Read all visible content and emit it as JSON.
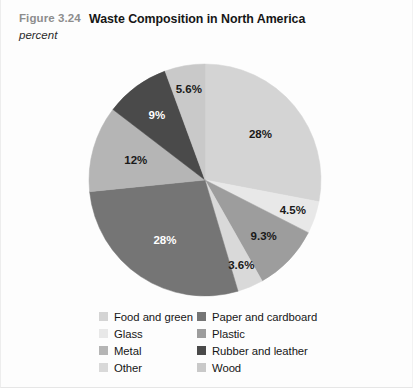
{
  "figure": {
    "number": "Figure 3.24",
    "title": "Waste Composition in North America",
    "units": "percent"
  },
  "chart_data": {
    "type": "pie",
    "title": "Waste Composition in North America",
    "subtitle": "Figure 3.24",
    "units": "percent",
    "ylabel": "",
    "xlabel": "",
    "legend_position": "bottom",
    "start_angle_deg": 0,
    "direction": "clockwise",
    "categories": [
      "Food and green",
      "Glass",
      "Plastic",
      "Other",
      "Paper and cardboard",
      "Metal",
      "Rubber and leather",
      "Wood"
    ],
    "values": [
      28,
      4.5,
      9.3,
      3.6,
      28,
      12,
      9,
      5.6
    ],
    "slices": [
      {
        "label": "Food and green",
        "value": 28,
        "display": "28%",
        "color": "#d4d4d4",
        "text_color": "#1a1a1a"
      },
      {
        "label": "Glass",
        "value": 4.5,
        "display": "4.5%",
        "color": "#e8e8e8",
        "text_color": "#1a1a1a"
      },
      {
        "label": "Plastic",
        "value": 9.3,
        "display": "9.3%",
        "color": "#9d9d9d",
        "text_color": "#1a1a1a"
      },
      {
        "label": "Other",
        "value": 3.6,
        "display": "3.6%",
        "color": "#d9d9d9",
        "text_color": "#1a1a1a"
      },
      {
        "label": "Paper and cardboard",
        "value": 28,
        "display": "28%",
        "color": "#757575",
        "text_color": "#ffffff"
      },
      {
        "label": "Metal",
        "value": 12,
        "display": "12%",
        "color": "#b5b5b5",
        "text_color": "#1a1a1a"
      },
      {
        "label": "Rubber and leather",
        "value": 9,
        "display": "9%",
        "color": "#4a4a4a",
        "text_color": "#ffffff"
      },
      {
        "label": "Wood",
        "value": 5.6,
        "display": "5.6%",
        "color": "#c9c9c9",
        "text_color": "#1a1a1a"
      }
    ]
  },
  "legend": {
    "left_column": [
      {
        "label": "Food and green",
        "color": "#d4d4d4"
      },
      {
        "label": "Glass",
        "color": "#e8e8e8"
      },
      {
        "label": "Metal",
        "color": "#b5b5b5"
      },
      {
        "label": "Other",
        "color": "#d9d9d9"
      }
    ],
    "right_column": [
      {
        "label": "Paper and cardboard",
        "color": "#757575"
      },
      {
        "label": "Plastic",
        "color": "#9d9d9d"
      },
      {
        "label": "Rubber and leather",
        "color": "#4a4a4a"
      },
      {
        "label": "Wood",
        "color": "#c9c9c9"
      }
    ]
  }
}
